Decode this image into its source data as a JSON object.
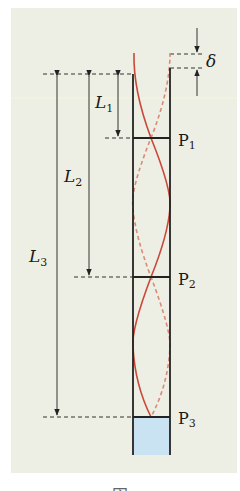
{
  "figure": {
    "panel_color": "#eeefe4",
    "wall_color": "#222222",
    "wave_color": "#c8493a",
    "water_color": "#c9e3f3",
    "labels": {
      "L1": {
        "main": "L",
        "sub": "1"
      },
      "L2": {
        "main": "L",
        "sub": "2"
      },
      "L3": {
        "main": "L",
        "sub": "3"
      },
      "delta": "δ",
      "P1": {
        "main": "P",
        "sub": "1"
      },
      "P2": {
        "main": "P",
        "sub": "2"
      },
      "P3": {
        "main": "P",
        "sub": "3"
      }
    },
    "caption": "図"
  }
}
